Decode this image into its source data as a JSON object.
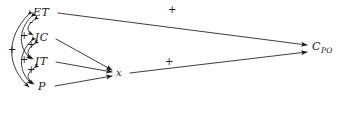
{
  "diagram": {
    "style": "hand-drawn causal path diagram",
    "ink_color": "#1a1a1a",
    "background_color": "#ffffff",
    "nodes": [
      {
        "id": "ET",
        "label": "ET",
        "x": 40,
        "y": 13
      },
      {
        "id": "IC",
        "label": "IC",
        "x": 42,
        "y": 38
      },
      {
        "id": "IT",
        "label": "IT",
        "x": 42,
        "y": 62
      },
      {
        "id": "P",
        "label": "P",
        "x": 44,
        "y": 87
      },
      {
        "id": "x",
        "label": "x",
        "x": 120,
        "y": 73
      },
      {
        "id": "C_PO",
        "label": "C",
        "sub": "PO",
        "x": 316,
        "y": 48
      }
    ],
    "directed_edges": [
      {
        "from": "ET",
        "to": "C_PO",
        "sign": "+"
      },
      {
        "from": "IC",
        "to": "x",
        "sign": ""
      },
      {
        "from": "IT",
        "to": "x",
        "sign": ""
      },
      {
        "from": "P",
        "to": "x",
        "sign": ""
      },
      {
        "from": "x",
        "to": "C_PO",
        "sign": "+"
      }
    ],
    "correlation_arcs": [
      {
        "between": [
          "ET",
          "IC"
        ],
        "sign": "-",
        "span": 1
      },
      {
        "between": [
          "IC",
          "IT"
        ],
        "sign": "+",
        "span": 1
      },
      {
        "between": [
          "IT",
          "P"
        ],
        "sign": "+",
        "span": 1
      },
      {
        "between": [
          "ET",
          "IT"
        ],
        "sign": "+",
        "span": 2
      },
      {
        "between": [
          "IC",
          "P"
        ],
        "sign": "+",
        "span": 2
      },
      {
        "between": [
          "ET",
          "P"
        ],
        "sign": "+",
        "span": 3
      }
    ],
    "sign_labels": [
      {
        "id": "sign-et-ic",
        "text": "-",
        "x": 29,
        "y": 21
      },
      {
        "id": "sign-ic-it",
        "text": "+",
        "x": 28,
        "y": 45
      },
      {
        "id": "sign-it-p",
        "text": "+",
        "x": 28,
        "y": 70
      },
      {
        "id": "sign-et-it",
        "text": "+",
        "x": 21,
        "y": 36
      },
      {
        "id": "sign-ic-p",
        "text": "+",
        "x": 21,
        "y": 60
      },
      {
        "id": "sign-et-p",
        "text": "+",
        "x": 10,
        "y": 50
      },
      {
        "id": "sign-et-cpo",
        "text": "+",
        "x": 169,
        "y": 8
      },
      {
        "id": "sign-x-cpo",
        "text": "+",
        "x": 166,
        "y": 60
      }
    ]
  }
}
